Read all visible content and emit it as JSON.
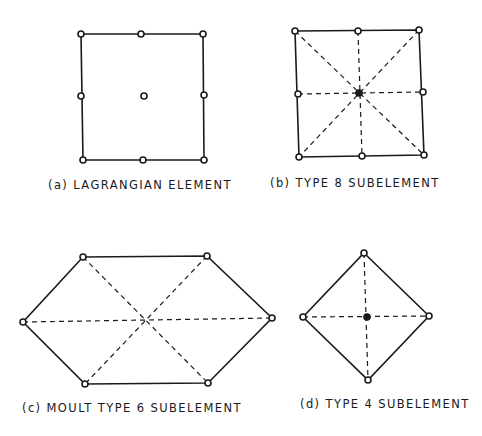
{
  "figure": {
    "panels": [
      {
        "id": "a",
        "caption": "(a) LAGRANGIAN ELEMENT",
        "shape": "square",
        "nodes": 9,
        "diagonals": false
      },
      {
        "id": "b",
        "caption": "(b) TYPE 8 SUBELEMENT",
        "shape": "square",
        "nodes": 9,
        "diagonals": true
      },
      {
        "id": "c",
        "caption": "(c) MOULT TYPE 6 SUBELEMENT",
        "shape": "hexagon",
        "nodes": 6,
        "diagonals": true
      },
      {
        "id": "d",
        "caption": "(d) TYPE 4 SUBELEMENT",
        "shape": "diamond",
        "nodes": 5,
        "diagonals": true
      }
    ],
    "colors": {
      "line": "#1a1a1a",
      "background": "#ffffff"
    }
  }
}
